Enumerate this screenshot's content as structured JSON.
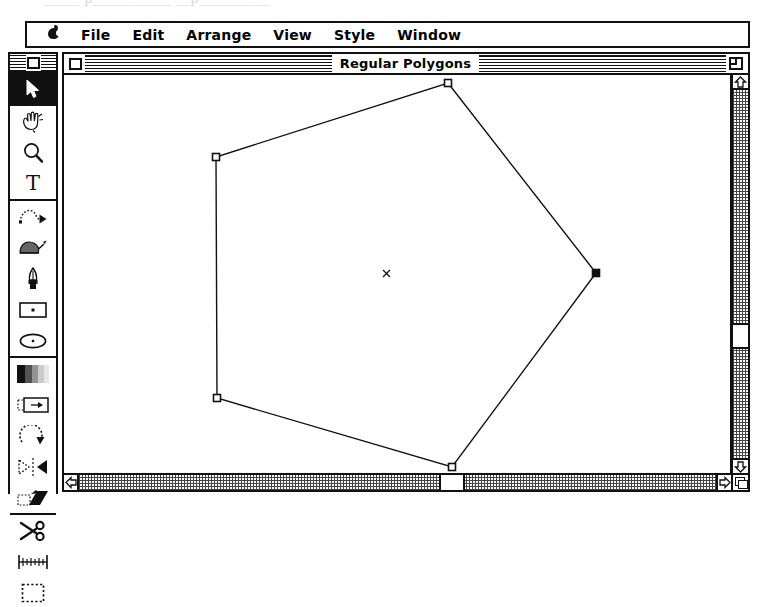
{
  "scan": {
    "ghost_text": "_____  p___________  __p__________"
  },
  "menubar": {
    "apple_icon": "apple-logo-icon",
    "items": [
      {
        "id": "file",
        "label": "File"
      },
      {
        "id": "edit",
        "label": "Edit"
      },
      {
        "id": "arrange",
        "label": "Arrange"
      },
      {
        "id": "view",
        "label": "View"
      },
      {
        "id": "style",
        "label": "Style"
      },
      {
        "id": "window",
        "label": "Window"
      }
    ]
  },
  "window": {
    "title": "Regular Polygons",
    "close_box": "close-box",
    "zoom_box": "zoom-box",
    "grow_box": "grow-box",
    "active": true
  },
  "palette": {
    "title_close_box": "close-box",
    "groups": [
      {
        "id": "select-group",
        "tools": [
          {
            "id": "arrow",
            "icon": "arrow-pointer-icon",
            "label": "Selection Arrow",
            "selected": true
          }
        ]
      },
      {
        "id": "view-group",
        "tools": [
          {
            "id": "hand",
            "icon": "hand-icon",
            "label": "Hand",
            "selected": false
          },
          {
            "id": "zoom",
            "icon": "magnifier-icon",
            "label": "Zoom",
            "selected": false
          },
          {
            "id": "text",
            "icon": "text-tool-icon",
            "label": "Text",
            "selected": false
          }
        ]
      },
      {
        "id": "draw-group",
        "tools": [
          {
            "id": "freehand",
            "icon": "bezier-path-icon",
            "label": "Bezier Path",
            "selected": false
          },
          {
            "id": "brush",
            "icon": "paint-brush-icon",
            "label": "Paint Brush",
            "selected": false
          },
          {
            "id": "pen",
            "icon": "pen-nib-icon",
            "label": "Pen",
            "selected": false
          },
          {
            "id": "rectangle",
            "icon": "rectangle-icon",
            "label": "Rectangle",
            "selected": false
          },
          {
            "id": "ellipse",
            "icon": "ellipse-icon",
            "label": "Ellipse",
            "selected": false
          }
        ]
      },
      {
        "id": "transform-group",
        "tools": [
          {
            "id": "blend",
            "icon": "blend-gradient-icon",
            "label": "Blend",
            "selected": false
          },
          {
            "id": "move",
            "icon": "move-object-icon",
            "label": "Move",
            "selected": false
          },
          {
            "id": "rotate",
            "icon": "rotate-icon",
            "label": "Rotate",
            "selected": false
          },
          {
            "id": "reflect",
            "icon": "reflect-flip-icon",
            "label": "Reflect",
            "selected": false
          },
          {
            "id": "skew",
            "icon": "skew-shear-icon",
            "label": "Skew",
            "selected": false
          }
        ]
      },
      {
        "id": "edit-group",
        "tools": [
          {
            "id": "scissors",
            "icon": "scissors-icon",
            "label": "Scissors",
            "selected": false
          },
          {
            "id": "measure",
            "icon": "ruler-icon",
            "label": "Measure",
            "selected": false
          },
          {
            "id": "marquee",
            "icon": "marquee-icon",
            "label": "Marquee",
            "selected": false
          }
        ]
      }
    ]
  },
  "scrollbars": {
    "vertical": {
      "up_arrow": "scroll-up-arrow",
      "down_arrow": "scroll-down-arrow",
      "thumb_top_px": 233
    },
    "horizontal": {
      "left_arrow": "scroll-left-arrow",
      "right_arrow": "scroll-right-arrow",
      "thumb_left_px": 360
    }
  },
  "drawing": {
    "name": "regular-pentagon",
    "center": {
      "x": 387,
      "y": 272,
      "marker": "center-cross"
    },
    "vertices": [
      {
        "id": "v-top",
        "x": 448,
        "y": 81,
        "handle": "hollow"
      },
      {
        "id": "v-right",
        "x": 596,
        "y": 271,
        "handle": "filled"
      },
      {
        "id": "v-bottom-right",
        "x": 452,
        "y": 465,
        "handle": "hollow"
      },
      {
        "id": "v-bottom-left",
        "x": 217,
        "y": 396,
        "handle": "hollow"
      },
      {
        "id": "v-left",
        "x": 216,
        "y": 155,
        "handle": "hollow"
      }
    ],
    "stroke_color": "#111111",
    "fill_color": "none"
  },
  "colors": {
    "ink": "#111111",
    "paper": "#ffffff",
    "scroll_pattern": "#444444"
  }
}
